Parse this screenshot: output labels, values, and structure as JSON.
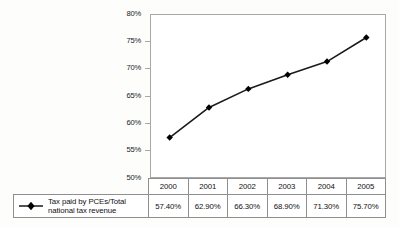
{
  "chart_data": {
    "type": "line",
    "title": "",
    "subtitle": "",
    "xlabel": "",
    "ylabel": "",
    "categories": [
      "2000",
      "2001",
      "2002",
      "2003",
      "2004",
      "2005"
    ],
    "series": [
      {
        "name": "Tax paid by PCEs/Total national tax revenue",
        "values": [
          57.4,
          62.9,
          66.3,
          68.9,
          71.3,
          75.7
        ],
        "value_labels": [
          "57.40%",
          "62.90%",
          "66.30%",
          "68.90%",
          "71.30%",
          "75.70%"
        ],
        "marker": "diamond",
        "marker_color": "#000000",
        "line_color": "#1a1a1a"
      }
    ],
    "ylim": [
      50,
      80
    ],
    "y_tick_values": [
      80,
      75,
      70,
      65,
      60,
      55,
      50
    ],
    "y_tick_labels": [
      "80%",
      "75%",
      "70%",
      "65%",
      "60%",
      "55%",
      "50%"
    ],
    "grid": false,
    "legend_position": "bottom-left",
    "data_table_visible": true
  },
  "axis": {
    "y_labels": [
      "80%",
      "75%",
      "70%",
      "65%",
      "60%",
      "55%",
      "50%"
    ]
  },
  "table": {
    "header": [
      "2000",
      "2001",
      "2002",
      "2003",
      "2004",
      "2005"
    ],
    "values": [
      "57.40%",
      "62.90%",
      "66.30%",
      "68.90%",
      "71.30%",
      "75.70%"
    ]
  },
  "legend": {
    "label_line1": "Tax paid by PCEs/Total",
    "label_line2": "national tax revenue",
    "marker_icon": "diamond-marker-icon"
  },
  "colors": {
    "line": "#1a1a1a",
    "marker": "#000000",
    "frame": "#a8a8a8",
    "table_border": "#8f8f8f",
    "text": "#111111",
    "page_background": "#fdfdfc",
    "plot_background": "#ffffff"
  }
}
